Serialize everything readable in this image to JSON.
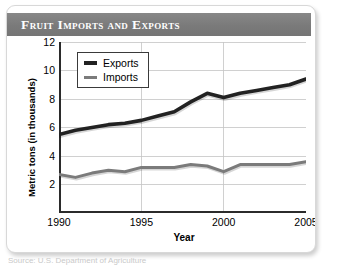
{
  "card": {
    "title": "Fruit Imports and Exports"
  },
  "source_note": "Source: U.S. Department of Agriculture",
  "chart_data": {
    "type": "line",
    "title": "Fruit Imports and Exports",
    "xlabel": "Year",
    "ylabel": "Metric tons (in thousands)",
    "xlim": [
      1990,
      2005
    ],
    "ylim": [
      0,
      12
    ],
    "xticks": [
      1990,
      1995,
      2000,
      2005
    ],
    "yticks": [
      2,
      4,
      6,
      8,
      10,
      12
    ],
    "grid": true,
    "legend_position": "upper left",
    "x": [
      1990,
      1991,
      1992,
      1993,
      1994,
      1995,
      1996,
      1997,
      1998,
      1999,
      2000,
      2001,
      2002,
      2003,
      2004,
      2005
    ],
    "series": [
      {
        "name": "Exports",
        "color": "#222222",
        "width": 3.6,
        "values": [
          5.5,
          5.8,
          6.0,
          6.2,
          6.3,
          6.5,
          6.8,
          7.1,
          7.8,
          8.4,
          8.1,
          8.4,
          8.6,
          8.8,
          9.0,
          9.4
        ]
      },
      {
        "name": "Imports",
        "color": "#7b7b7b",
        "width": 3.0,
        "values": [
          2.7,
          2.5,
          2.8,
          3.0,
          2.9,
          3.2,
          3.2,
          3.2,
          3.4,
          3.3,
          2.9,
          3.4,
          3.4,
          3.4,
          3.4,
          3.6
        ]
      }
    ]
  }
}
